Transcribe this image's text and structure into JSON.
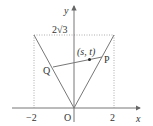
{
  "diagram": {
    "axes": {
      "x_label": "x",
      "y_label": "y"
    },
    "ticks": {
      "x_neg": "−2",
      "x_pos": "2",
      "origin": "O",
      "y_top": "2√3"
    },
    "points": {
      "P": "P",
      "Q": "Q",
      "mid": "(s, t)"
    },
    "colors": {
      "line": "#777777",
      "dotted": "#999999",
      "text": "#333333"
    }
  }
}
